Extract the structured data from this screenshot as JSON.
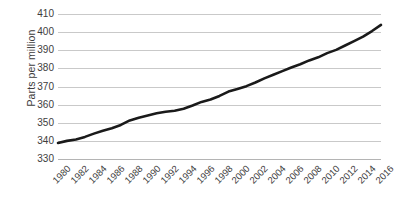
{
  "chart_data": {
    "type": "line",
    "title": "",
    "xlabel": "",
    "ylabel": "Parts per million",
    "xlim": [
      1980,
      2016
    ],
    "ylim": [
      330,
      410
    ],
    "grid": true,
    "legend": "none",
    "series_color": "#1a1a1a",
    "gridline_color": "#c9c9c9",
    "text_color": "#3d3d3d",
    "background_color": "#ffffff",
    "ytick_labels": [
      "410",
      "400",
      "390",
      "380",
      "370",
      "360",
      "350",
      "340",
      "330"
    ],
    "ytick_values": [
      410,
      400,
      390,
      380,
      370,
      360,
      350,
      340,
      330
    ],
    "xtick_labels": [
      "1980",
      "1982",
      "1984",
      "1986",
      "1988",
      "1990",
      "1992",
      "1994",
      "1996",
      "1998",
      "2000",
      "2002",
      "2004",
      "2006",
      "2008",
      "2010",
      "2012",
      "2014",
      "2016"
    ],
    "xtick_values": [
      1980,
      1982,
      1984,
      1986,
      1988,
      1990,
      1992,
      1994,
      1996,
      1998,
      2000,
      2002,
      2004,
      2006,
      2008,
      2010,
      2012,
      2014,
      2016
    ],
    "x": [
      1980,
      1981,
      1982,
      1983,
      1984,
      1985,
      1986,
      1987,
      1988,
      1989,
      1990,
      1991,
      1992,
      1993,
      1994,
      1995,
      1996,
      1997,
      1998,
      1999,
      2000,
      2001,
      2002,
      2003,
      2004,
      2005,
      2006,
      2007,
      2008,
      2009,
      2010,
      2011,
      2012,
      2013,
      2014,
      2015,
      2016
    ],
    "values": [
      338.8,
      340.0,
      340.8,
      342.2,
      344.0,
      345.6,
      347.0,
      348.8,
      351.3,
      352.8,
      354.0,
      355.2,
      356.1,
      356.6,
      357.7,
      359.5,
      361.5,
      362.8,
      364.8,
      367.2,
      368.6,
      370.2,
      372.2,
      374.5,
      376.5,
      378.5,
      380.5,
      382.3,
      384.4,
      386.1,
      388.4,
      390.2,
      392.6,
      395.0,
      397.5,
      400.6,
      404.0
    ]
  },
  "axes": {
    "y_title": "Parts per million"
  }
}
